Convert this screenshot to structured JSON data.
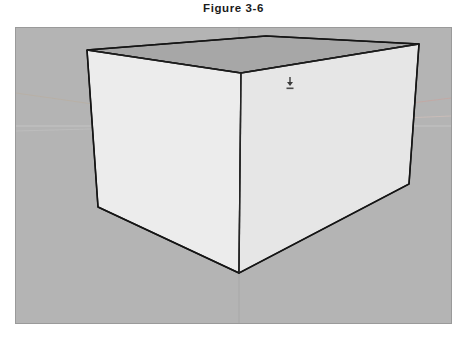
{
  "figure": {
    "caption": "Figure 3-6"
  },
  "canvas": {
    "name": "sketchup-modeling-viewport",
    "background_color": "#b4b4b4",
    "border_color": "#9a9a9a",
    "width": 437,
    "height": 297
  },
  "axes": {
    "horizon_color": "#c8c8c8",
    "green_axis_color": "#b9b2a8",
    "red_axis_color": "#c3aaa6",
    "blue_axis_color": "#a9a9a9",
    "horizon_y": 97,
    "blue_axis_x": 223,
    "origin": {
      "x": 223,
      "y": 97
    }
  },
  "model": {
    "name": "rectangular-box",
    "top_face_color": "#a7a7a7",
    "left_face_color": "#ececec",
    "right_face_color": "#e4e4e4",
    "edge_color": "#1c1c1c",
    "vertices": {
      "top_back_left": {
        "x": 71,
        "y": 22
      },
      "top_front": {
        "x": 225,
        "y": 45
      },
      "top_back_right": {
        "x": 403,
        "y": 16
      },
      "top_far": {
        "x": 250,
        "y": 8
      },
      "bottom_left": {
        "x": 82,
        "y": 179
      },
      "bottom_front": {
        "x": 223,
        "y": 245
      },
      "bottom_right": {
        "x": 393,
        "y": 156
      }
    }
  },
  "cursor": {
    "icon_name": "push-pull-tool-cursor",
    "x": 268,
    "y": 49
  }
}
